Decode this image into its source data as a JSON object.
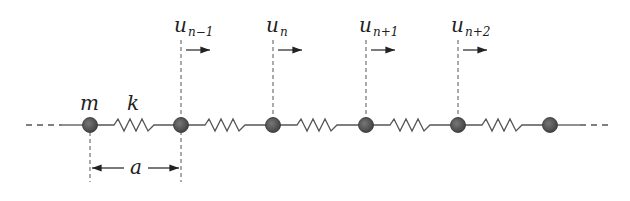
{
  "diagram": {
    "mass_label": "m",
    "spring_label": "k",
    "spacing_label": "a",
    "displacements": [
      {
        "base": "u",
        "sub": "n−1"
      },
      {
        "base": "u",
        "sub": "n"
      },
      {
        "base": "u",
        "sub": "n+1"
      },
      {
        "base": "u",
        "sub": "n+2"
      }
    ],
    "colors": {
      "mass": "#555555",
      "line": "#555555",
      "text": "#222222"
    }
  }
}
